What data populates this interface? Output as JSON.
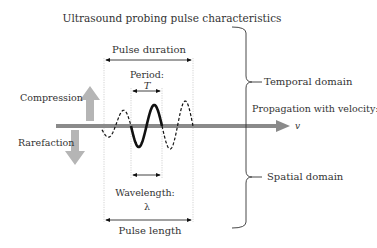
{
  "title": "Ultrasound probing pulse characteristics",
  "labels": {
    "pulse_duration": "Pulse duration",
    "period": "Period:",
    "period_symbol": "T",
    "compression": "Compression",
    "rarefaction": "Rarefaction",
    "propagation": "Propagation with velocity:",
    "velocity_symbol": "v",
    "wavelength": "Wavelength:",
    "wavelength_symbol": "λ",
    "pulse_length": "Pulse length",
    "temporal_domain": "Temporal domain",
    "spatial_domain": "Spatial domain"
  },
  "colors": {
    "text": "#333333",
    "wave": "#111111",
    "axis": "#8a8a8a",
    "arrow_gray": "#b5b5b5",
    "guide": "#c8c8c8"
  },
  "wave": {
    "cycles_dashed_before": 1,
    "cycles_solid": 1,
    "cycles_dashed_after": 1
  }
}
